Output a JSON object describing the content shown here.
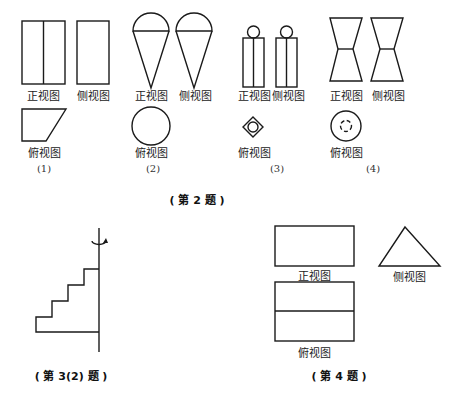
{
  "labels": {
    "front_view": "正视图",
    "side_view": "侧视图",
    "top_view": "俯视图"
  },
  "figure_numbers": [
    "(1)",
    "(2)",
    "(3)",
    "(4)"
  ],
  "captions": {
    "problem2": "( 第 2 题 )",
    "problem3_2": "( 第 3(2) 题 )",
    "problem4": "( 第 4 题 )"
  }
}
